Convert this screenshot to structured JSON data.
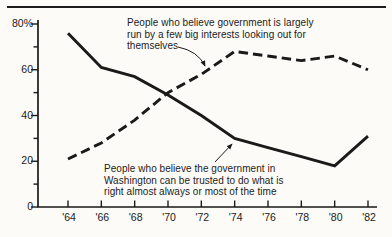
{
  "figure": {
    "background": "#fcfbf7",
    "ink": "#1a1a1a"
  },
  "chart_data": {
    "type": "line",
    "title": "",
    "xlabel": "",
    "ylabel": "",
    "categories": [
      "'64",
      "'66",
      "'68",
      "'70",
      "'72",
      "'74",
      "'76",
      "'78",
      "'80",
      "'82"
    ],
    "ylim": [
      0,
      80
    ],
    "y_minor_step": 10,
    "y_major_ticks": [
      {
        "value": 80,
        "label": "80%"
      },
      {
        "value": 60,
        "label": "60"
      },
      {
        "value": 40,
        "label": "40"
      },
      {
        "value": 20,
        "label": "20"
      },
      {
        "value": 0,
        "label": "0"
      }
    ],
    "grid": false,
    "legend_position": "inline-annotations-with-arrows",
    "series": [
      {
        "name": "big-interests",
        "line_style": "dashed",
        "label": "People who believe government is largely run by a few big interests looking out for themselves",
        "values": [
          21,
          28,
          38,
          50,
          58,
          68,
          66,
          64,
          66,
          60
        ]
      },
      {
        "name": "trust-in-government",
        "line_style": "solid",
        "label": "People who believe the government in Washington can be trusted to do what is right almost always or most of the time",
        "values": [
          76,
          61,
          57,
          49,
          40,
          30,
          26,
          22,
          18,
          31
        ]
      }
    ]
  },
  "annotations": {
    "big_interests": {
      "lines": [
        "People who believe government is largely",
        "run by a few big interests looking out for",
        "themselves"
      ]
    },
    "trust": {
      "lines": [
        "People who believe the government in",
        "Washington can be trusted to do what is",
        "right almost always or most of the time"
      ]
    }
  }
}
